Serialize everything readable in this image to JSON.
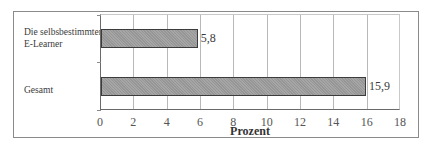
{
  "chart_data": {
    "type": "bar",
    "orientation": "horizontal",
    "title": "",
    "categories": [
      "Die selbsbestimmten E-Learner",
      "Gesamt"
    ],
    "category_lines": [
      [
        "Die selbsbestimmten",
        "E-Learner"
      ],
      [
        "Gesamt"
      ]
    ],
    "values": [
      5.8,
      15.9
    ],
    "value_labels": [
      "5,8",
      "15,9"
    ],
    "xlabel": "Prozent",
    "ylabel": "",
    "xlim": [
      0,
      18
    ],
    "xticks": [
      "0",
      "2",
      "4",
      "6",
      "8",
      "10",
      "12",
      "14",
      "16",
      "18"
    ],
    "grid": true,
    "legend": null,
    "bar_color": "#9e9e9e"
  }
}
